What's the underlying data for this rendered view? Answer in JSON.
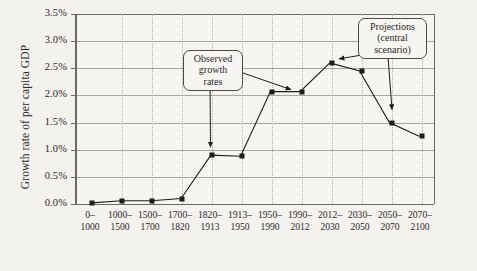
{
  "chart_data": {
    "type": "line",
    "title": "",
    "xlabel": "",
    "ylabel": "Growth rate of per capita GDP",
    "ylim": [
      0,
      3.5
    ],
    "ytick_labels": [
      "0.0%",
      "0.5%",
      "1.0%",
      "1.5%",
      "2.0%",
      "2.5%",
      "3.0%",
      "3.5%"
    ],
    "ytick_values": [
      0.0,
      0.5,
      1.0,
      1.5,
      2.0,
      2.5,
      3.0,
      3.5
    ],
    "grid": "horizontal solid, vertical dotted",
    "legend": "none",
    "categories": [
      {
        "top": "0–",
        "bottom": "1000"
      },
      {
        "top": "1000–",
        "bottom": "1500"
      },
      {
        "top": "1500–",
        "bottom": "1700"
      },
      {
        "top": "1700–",
        "bottom": "1820"
      },
      {
        "top": "1820–",
        "bottom": "1913"
      },
      {
        "top": "1913–",
        "bottom": "1950"
      },
      {
        "top": "1950–",
        "bottom": "1990"
      },
      {
        "top": "1990–",
        "bottom": "2012"
      },
      {
        "top": "2012–",
        "bottom": "2030"
      },
      {
        "top": "2030–",
        "bottom": "2050"
      },
      {
        "top": "2050–",
        "bottom": "2070"
      },
      {
        "top": "2070–",
        "bottom": "2100"
      }
    ],
    "values": [
      0.02,
      0.06,
      0.06,
      0.1,
      0.9,
      0.88,
      2.07,
      2.07,
      2.6,
      2.45,
      1.5,
      1.25
    ],
    "marker": "square",
    "line_color": "#1d1c1a",
    "annotations": [
      {
        "id": "observed",
        "lines": [
          "Observed",
          "growth",
          "rates"
        ],
        "arrow_targets": [
          "1820–1913",
          "1990–2012"
        ]
      },
      {
        "id": "projections",
        "lines": [
          "Projections",
          "(central",
          "scenario)"
        ],
        "arrow_targets": [
          "2012–2030",
          "2050–2070"
        ]
      }
    ]
  },
  "ylabel": "Growth rate of per capita GDP"
}
